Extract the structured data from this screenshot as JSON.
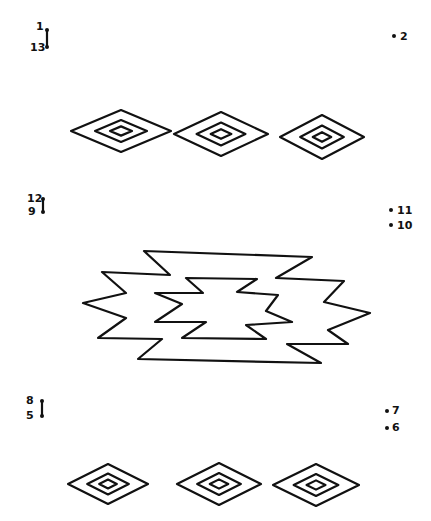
{
  "dots": [
    {
      "label": "1",
      "x": 47,
      "y": 30,
      "label_x": 36,
      "label_y": 21
    },
    {
      "label": "13",
      "x": 47,
      "y": 47,
      "label_x": 30,
      "label_y": 42
    },
    {
      "label": "2",
      "x": 394,
      "y": 36,
      "label_x": 400,
      "label_y": 31
    },
    {
      "label": "12",
      "x": 43,
      "y": 199,
      "label_x": 27,
      "label_y": 193
    },
    {
      "label": "9",
      "x": 43,
      "y": 212,
      "label_x": 28,
      "label_y": 206
    },
    {
      "label": "11",
      "x": 391,
      "y": 210,
      "label_x": 397,
      "label_y": 205
    },
    {
      "label": "10",
      "x": 391,
      "y": 225,
      "label_x": 397,
      "label_y": 220
    },
    {
      "label": "8",
      "x": 42,
      "y": 401,
      "label_x": 26,
      "label_y": 395
    },
    {
      "label": "5",
      "x": 42,
      "y": 416,
      "label_x": 26,
      "label_y": 410
    },
    {
      "label": "7",
      "x": 387,
      "y": 411,
      "label_x": 392,
      "label_y": 405
    },
    {
      "label": "6",
      "x": 387,
      "y": 428,
      "label_x": 392,
      "label_y": 422
    }
  ],
  "pre_lines": [
    {
      "from": "1",
      "to": "13"
    },
    {
      "from": "12",
      "to": "9"
    },
    {
      "from": "8",
      "to": "5"
    }
  ],
  "diamonds_top": [
    {
      "cx": 121,
      "cy": 131,
      "rx": 50,
      "ry": 21
    },
    {
      "cx": 221,
      "cy": 134,
      "rx": 47,
      "ry": 22
    },
    {
      "cx": 322,
      "cy": 137,
      "rx": 42,
      "ry": 22
    }
  ],
  "diamonds_bottom": [
    {
      "cx": 108,
      "cy": 484,
      "rx": 40,
      "ry": 20
    },
    {
      "cx": 219,
      "cy": 484,
      "rx": 42,
      "ry": 21
    },
    {
      "cx": 316,
      "cy": 485,
      "rx": 43,
      "ry": 21
    }
  ],
  "zigzag": {
    "outer": "144,251 312,257 276,278 344,281 324,302 370,313 328,330 348,344 287,344 321,363 138,359 162,339 98,338 126,318 83,303 126,293 102,272 170,275",
    "inner": "186,278 257,279 237,292 278,295 266,311 292,322 246,325 266,339 182,338 206,322 155,322 182,304 155,293 203,293"
  }
}
